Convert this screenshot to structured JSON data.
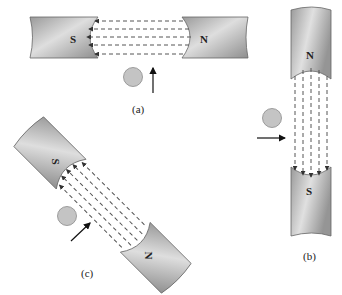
{
  "colors": {
    "magnet_light": "#d8d8d8",
    "magnet_dark": "#8e8e8e",
    "field_line": "#555555",
    "ball_fill": "#c4c4c4",
    "arrow": "#111111",
    "background": "#ffffff"
  },
  "panels": [
    {
      "id": "a",
      "caption": "(a)",
      "left_pole": "S",
      "right_pole": "N",
      "field_direction": "N to S (leftward)",
      "field_line_count": 5,
      "particle_velocity": "upward"
    },
    {
      "id": "b",
      "caption": "(b)",
      "top_pole": "N",
      "bottom_pole": "S",
      "field_direction": "N to S (downward)",
      "field_line_count": 5,
      "particle_velocity": "rightward"
    },
    {
      "id": "c",
      "caption": "(c)",
      "upper_pole": "S",
      "lower_pole": "N",
      "field_direction": "N to S (diagonal up-left)",
      "field_line_count": 5,
      "particle_velocity": "diagonal up-right"
    }
  ],
  "icons": {
    "particle": "gray-circle",
    "velocity": "arrow",
    "field": "dashed-arrow-lines"
  }
}
